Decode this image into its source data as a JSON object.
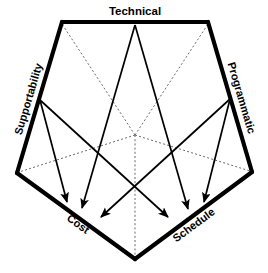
{
  "diagram": {
    "title": "Technical",
    "type": "pentagon-influence-diagram",
    "colors": {
      "outline": "#000000",
      "spoke": "#6b6b6b",
      "arrow": "#000000",
      "background": "#ffffff"
    },
    "labels": {
      "technical": "Technical",
      "supportability": "Supportability",
      "programmatic": "Programmatic",
      "cost": "Cost",
      "schedule": "Schedule"
    },
    "edges": [
      {
        "id": "technical",
        "label": "Technical",
        "rotation": 0
      },
      {
        "id": "supportability",
        "label": "Supportability",
        "rotation": -72
      },
      {
        "id": "programmatic",
        "label": "Programmatic",
        "rotation": 72
      },
      {
        "id": "cost",
        "label": "Cost",
        "rotation": 36
      },
      {
        "id": "schedule",
        "label": "Schedule",
        "rotation": -36
      }
    ],
    "vertices": {
      "top_left": {
        "x": 62,
        "y": 22
      },
      "top_right": {
        "x": 208,
        "y": 22
      },
      "right": {
        "x": 252,
        "y": 172
      },
      "bottom": {
        "x": 135,
        "y": 259
      },
      "left": {
        "x": 17,
        "y": 173
      }
    },
    "center": {
      "x": 135,
      "y": 135
    },
    "edge_midpoints": {
      "technical": {
        "x": 135,
        "y": 22
      },
      "supportability": {
        "x": 40,
        "y": 98
      },
      "programmatic": {
        "x": 230,
        "y": 97
      },
      "cost": {
        "x": 76,
        "y": 216
      },
      "schedule": {
        "x": 194,
        "y": 216
      }
    },
    "flows": [
      {
        "from": "technical",
        "to": "cost"
      },
      {
        "from": "technical",
        "to": "schedule"
      },
      {
        "from": "supportability",
        "to": "cost"
      },
      {
        "from": "supportability",
        "to": "schedule"
      },
      {
        "from": "programmatic",
        "to": "cost"
      },
      {
        "from": "programmatic",
        "to": "schedule"
      }
    ],
    "arrow_targets": {
      "cost": [
        {
          "x": 68,
          "y": 205
        },
        {
          "x": 81,
          "y": 211
        },
        {
          "x": 98,
          "y": 220
        }
      ],
      "schedule": [
        {
          "x": 171,
          "y": 220
        },
        {
          "x": 190,
          "y": 212
        },
        {
          "x": 203,
          "y": 205
        }
      ]
    }
  }
}
